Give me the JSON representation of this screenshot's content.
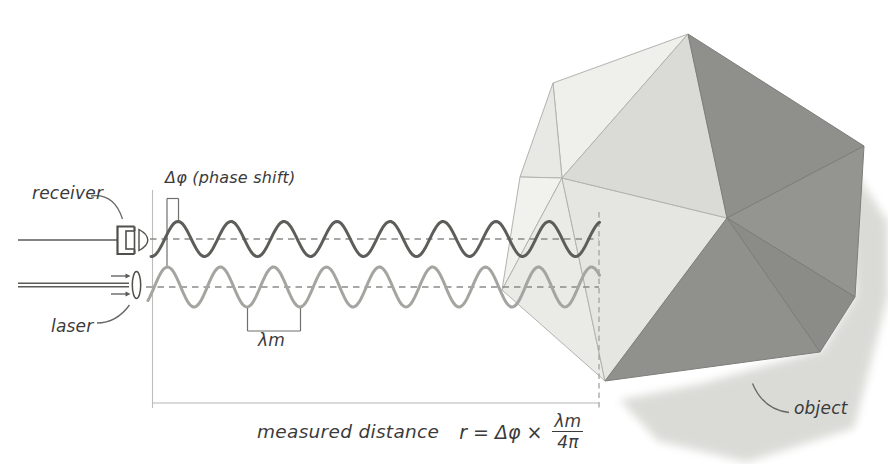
{
  "labels": {
    "receiver": "receiver",
    "laser": "laser",
    "phase_shift": "Δφ (phase shift)",
    "wavelength": "λm",
    "object": "object"
  },
  "formula": {
    "prefix": "measured distance",
    "expression": "r = Δφ ×",
    "numerator": "λm",
    "denominator": "4π"
  },
  "diagram": {
    "waves": [
      {
        "name": "received-wave",
        "axis_y": 239,
        "amplitude": 17.5,
        "period": 53,
        "peak_x": 178,
        "x_start": 151,
        "x_end": 599.5,
        "color": "#5d5d5a",
        "width": 3
      },
      {
        "name": "reference-wave",
        "axis_y": 287,
        "amplitude": 20,
        "period": 53,
        "peak_x": 167.5,
        "x_start": 148,
        "x_end": 599.5,
        "color": "#a4a4a0",
        "width": 3
      }
    ],
    "object_shape": {
      "vertices": {
        "A": [
          688,
          34
        ],
        "B": [
          553,
          83
        ],
        "C": [
          520,
          177
        ],
        "L": [
          502,
          290
        ],
        "M": [
          562,
          178
        ],
        "G": [
          727,
          218
        ],
        "BV": [
          605,
          381
        ],
        "R": [
          864,
          146
        ],
        "RB": [
          855,
          297
        ],
        "DB": [
          820,
          352
        ]
      },
      "faces": [
        {
          "pts": [
            "A",
            "B",
            "M"
          ],
          "fill": "#efefeb",
          "stroke": "#b2b2ae"
        },
        {
          "pts": [
            "B",
            "C",
            "M"
          ],
          "fill": "#e8e8e4",
          "stroke": "#b2b2ae"
        },
        {
          "pts": [
            "C",
            "M",
            "L"
          ],
          "fill": "#f1f1ed",
          "stroke": "#b2b2ae"
        },
        {
          "pts": [
            "M",
            "L",
            "BV"
          ],
          "fill": "#eaeae6",
          "stroke": "#b2b2ae"
        },
        {
          "pts": [
            "M",
            "BV",
            "G"
          ],
          "fill": "#e5e5e1",
          "stroke": "#b2b2ae"
        },
        {
          "pts": [
            "A",
            "M",
            "G"
          ],
          "fill": "#dadad6",
          "stroke": "#b2b2ae"
        },
        {
          "pts": [
            "A",
            "G",
            "R"
          ],
          "fill": "#8f8f8c",
          "stroke": "#7d7d7a"
        },
        {
          "pts": [
            "G",
            "R",
            "RB"
          ],
          "fill": "#949491",
          "stroke": "#7d7d7a"
        },
        {
          "pts": [
            "G",
            "RB",
            "DB"
          ],
          "fill": "#8b8b88",
          "stroke": "#7d7d7a"
        },
        {
          "pts": [
            "G",
            "DB",
            "BV"
          ],
          "fill": "#90908d",
          "stroke": "#7d7d7a"
        }
      ],
      "shadow": {
        "points": [
          [
            846,
            158
          ],
          [
            888,
            222
          ],
          [
            888,
            296
          ],
          [
            854,
            428
          ],
          [
            747,
            462
          ],
          [
            658,
            441
          ],
          [
            620,
            400
          ],
          [
            700,
            384
          ],
          [
            822,
            350
          ],
          [
            855,
            295
          ]
        ],
        "fill": "#d7d7d3",
        "opacity": 0.9
      }
    }
  }
}
